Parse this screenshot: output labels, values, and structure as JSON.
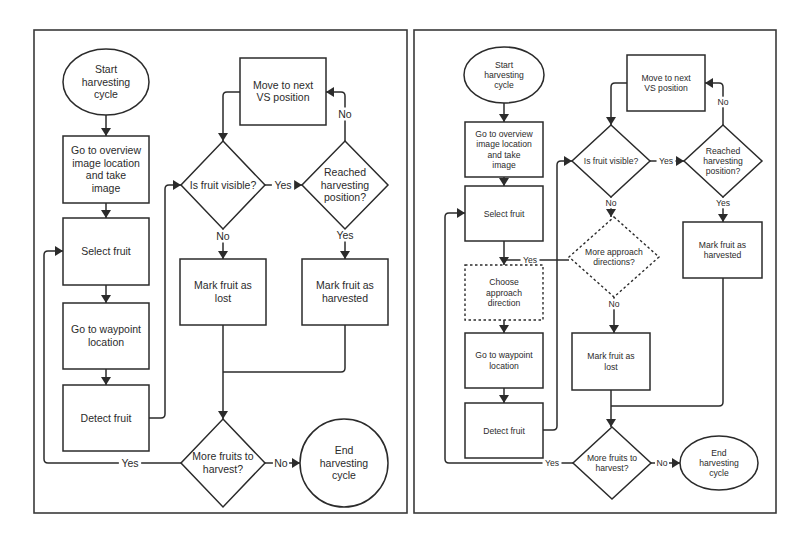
{
  "figure": {
    "colors": {
      "stroke": "#2b2b2b",
      "background": "#ffffff",
      "border": "#3a3a3a"
    },
    "panels": [
      {
        "id": "left",
        "name": "flowchart-original",
        "border": {
          "x": 34,
          "y": 30,
          "w": 373,
          "h": 483
        },
        "font_size": 10.5,
        "edge_font_size": 10.5,
        "nodes": [
          {
            "id": "start",
            "type": "ellipse",
            "cx": 106,
            "cy": 82,
            "rx": 43,
            "ry": 33,
            "lines": [
              "Start",
              "harvesting",
              "cycle"
            ]
          },
          {
            "id": "overview",
            "type": "rect",
            "x": 63,
            "y": 136,
            "w": 86,
            "h": 67,
            "lines": [
              "Go to overview",
              "image location",
              "and take",
              "image"
            ]
          },
          {
            "id": "select",
            "type": "rect",
            "x": 63,
            "y": 218,
            "w": 86,
            "h": 67,
            "lines": [
              "Select fruit"
            ]
          },
          {
            "id": "waypoint",
            "type": "rect",
            "x": 63,
            "y": 303,
            "w": 86,
            "h": 66,
            "lines": [
              "Go to waypoint",
              "location"
            ]
          },
          {
            "id": "detect",
            "type": "rect",
            "x": 63,
            "y": 385,
            "w": 86,
            "h": 66,
            "lines": [
              "Detect fruit"
            ]
          },
          {
            "id": "visible",
            "type": "diamond",
            "cx": 223,
            "cy": 185,
            "hw": 42,
            "hh": 44,
            "lines": [
              "Is fruit visible?"
            ]
          },
          {
            "id": "move",
            "type": "rect",
            "x": 240,
            "y": 58,
            "w": 86,
            "h": 67,
            "lines": [
              "Move to next",
              "VS position"
            ]
          },
          {
            "id": "reached",
            "type": "diamond",
            "cx": 345,
            "cy": 185,
            "hw": 43,
            "hh": 44,
            "lines": [
              "Reached",
              "harvesting",
              "position?"
            ]
          },
          {
            "id": "lost",
            "type": "rect",
            "x": 180,
            "y": 259,
            "w": 86,
            "h": 66,
            "lines": [
              "Mark fruit as",
              "lost"
            ]
          },
          {
            "id": "harvested",
            "type": "rect",
            "x": 302,
            "y": 259,
            "w": 86,
            "h": 66,
            "lines": [
              "Mark fruit as",
              "harvested"
            ]
          },
          {
            "id": "more",
            "type": "diamond",
            "cx": 223,
            "cy": 463,
            "hw": 42,
            "hh": 44,
            "lines": [
              "More fruits to",
              "harvest?"
            ]
          },
          {
            "id": "end",
            "type": "ellipse",
            "cx": 344,
            "cy": 463,
            "rx": 44,
            "ry": 44,
            "lines": [
              "End",
              "harvesting",
              "cycle"
            ]
          }
        ],
        "edges": [
          {
            "from": "start",
            "to": "overview",
            "points": [
              [
                106,
                115
              ],
              [
                106,
                136
              ]
            ]
          },
          {
            "from": "overview",
            "to": "select",
            "points": [
              [
                106,
                203
              ],
              [
                106,
                218
              ]
            ]
          },
          {
            "from": "select",
            "to": "waypoint",
            "points": [
              [
                106,
                285
              ],
              [
                106,
                303
              ]
            ]
          },
          {
            "from": "waypoint",
            "to": "detect",
            "points": [
              [
                106,
                369
              ],
              [
                106,
                385
              ]
            ]
          },
          {
            "from": "detect",
            "to": "visible",
            "points": [
              [
                149,
                418
              ],
              [
                165,
                418
              ],
              [
                165,
                185
              ],
              [
                181,
                185
              ]
            ]
          },
          {
            "from": "visible",
            "to": "reached",
            "points": [
              [
                265,
                185
              ],
              [
                302,
                185
              ]
            ],
            "label": "Yes",
            "label_x": 283,
            "label_y": 185
          },
          {
            "from": "visible",
            "to": "lost",
            "points": [
              [
                223,
                229
              ],
              [
                223,
                259
              ]
            ],
            "label": "No",
            "label_x": 223,
            "label_y": 236
          },
          {
            "from": "reached",
            "to": "move",
            "points": [
              [
                345,
                141
              ],
              [
                345,
                92
              ],
              [
                326,
                92
              ]
            ],
            "label": "No",
            "label_x": 345,
            "label_y": 114
          },
          {
            "from": "move",
            "to": "visible",
            "points": [
              [
                240,
                92
              ],
              [
                223,
                92
              ],
              [
                223,
                141
              ]
            ]
          },
          {
            "from": "reached",
            "to": "harvested",
            "points": [
              [
                345,
                229
              ],
              [
                345,
                259
              ]
            ],
            "label": "Yes",
            "label_x": 345,
            "label_y": 235
          },
          {
            "from": "lost",
            "to": "more",
            "points": [
              [
                223,
                325
              ],
              [
                223,
                419
              ]
            ]
          },
          {
            "from": "harvested",
            "to": "more",
            "points": [
              [
                345,
                325
              ],
              [
                345,
                372
              ],
              [
                223,
                372
              ]
            ],
            "noarrow": true
          },
          {
            "from": "more",
            "to": "end",
            "points": [
              [
                265,
                463
              ],
              [
                300,
                463
              ]
            ],
            "label": "No",
            "label_x": 281,
            "label_y": 463
          },
          {
            "from": "more",
            "to": "select",
            "points": [
              [
                181,
                463
              ],
              [
                44,
                463
              ],
              [
                44,
                251
              ],
              [
                63,
                251
              ]
            ],
            "label": "Yes",
            "label_x": 130,
            "label_y": 463
          }
        ]
      },
      {
        "id": "right",
        "name": "flowchart-with-approach-directions",
        "border": {
          "x": 414,
          "y": 30,
          "w": 362,
          "h": 483
        },
        "font_size": 8.6,
        "edge_font_size": 8.6,
        "nodes": [
          {
            "id": "start",
            "type": "ellipse",
            "cx": 504,
            "cy": 75,
            "rx": 40,
            "ry": 28,
            "lines": [
              "Start",
              "harvesting",
              "cycle"
            ]
          },
          {
            "id": "overview",
            "type": "rect",
            "x": 465,
            "y": 122,
            "w": 78,
            "h": 55,
            "lines": [
              "Go to overview",
              "image location",
              "and take",
              "image"
            ]
          },
          {
            "id": "select",
            "type": "rect",
            "x": 465,
            "y": 186,
            "w": 78,
            "h": 55,
            "lines": [
              "Select fruit"
            ]
          },
          {
            "id": "choose",
            "type": "rect",
            "dashed": true,
            "x": 465,
            "y": 265,
            "w": 78,
            "h": 55,
            "lines": [
              "Choose",
              "approach",
              "direction"
            ]
          },
          {
            "id": "waypoint",
            "type": "rect",
            "x": 465,
            "y": 333,
            "w": 78,
            "h": 55,
            "lines": [
              "Go to waypoint",
              "location"
            ]
          },
          {
            "id": "detect",
            "type": "rect",
            "x": 465,
            "y": 403,
            "w": 78,
            "h": 55,
            "lines": [
              "Detect fruit"
            ]
          },
          {
            "id": "visible",
            "type": "diamond",
            "cx": 611,
            "cy": 161,
            "hw": 39,
            "hh": 36,
            "lines": [
              "Is fruit visible?"
            ]
          },
          {
            "id": "move",
            "type": "rect",
            "x": 627,
            "y": 55,
            "w": 78,
            "h": 56,
            "lines": [
              "Move to next",
              "VS position"
            ]
          },
          {
            "id": "reached",
            "type": "diamond",
            "cx": 723,
            "cy": 161,
            "hw": 39,
            "hh": 36,
            "lines": [
              "Reached",
              "harvesting",
              "position?"
            ]
          },
          {
            "id": "approach",
            "type": "diamond",
            "dashed": true,
            "cx": 614,
            "cy": 257,
            "hw": 45,
            "hh": 40,
            "lines": [
              "More approach",
              "directions?"
            ]
          },
          {
            "id": "lost",
            "type": "rect",
            "x": 572,
            "y": 333,
            "w": 78,
            "h": 57,
            "lines": [
              "Mark fruit as",
              "lost"
            ]
          },
          {
            "id": "harvested",
            "type": "rect",
            "x": 683,
            "y": 222,
            "w": 79,
            "h": 56,
            "lines": [
              "Mark fruit as",
              "harvested"
            ]
          },
          {
            "id": "more",
            "type": "diamond",
            "cx": 612,
            "cy": 463,
            "hw": 39,
            "hh": 36,
            "lines": [
              "More fruits to",
              "harvest?"
            ]
          },
          {
            "id": "end",
            "type": "ellipse",
            "cx": 719,
            "cy": 463,
            "rx": 39,
            "ry": 27,
            "lines": [
              "End",
              "harvesting",
              "cycle"
            ]
          }
        ],
        "edges": [
          {
            "from": "start",
            "to": "overview",
            "points": [
              [
                504,
                103
              ],
              [
                504,
                122
              ]
            ]
          },
          {
            "from": "overview",
            "to": "select",
            "points": [
              [
                504,
                177
              ],
              [
                504,
                186
              ]
            ]
          },
          {
            "from": "select",
            "to": "choose",
            "points": [
              [
                504,
                241
              ],
              [
                504,
                265
              ]
            ]
          },
          {
            "from": "choose",
            "to": "waypoint",
            "points": [
              [
                504,
                320
              ],
              [
                504,
                333
              ]
            ]
          },
          {
            "from": "waypoint",
            "to": "detect",
            "points": [
              [
                504,
                388
              ],
              [
                504,
                403
              ]
            ]
          },
          {
            "from": "detect",
            "to": "visible",
            "points": [
              [
                543,
                430
              ],
              [
                557,
                430
              ],
              [
                557,
                161
              ],
              [
                572,
                161
              ]
            ]
          },
          {
            "from": "visible",
            "to": "reached",
            "points": [
              [
                650,
                161
              ],
              [
                684,
                161
              ]
            ],
            "label": "Yes",
            "label_x": 666,
            "label_y": 161
          },
          {
            "from": "visible",
            "to": "approach",
            "points": [
              [
                611,
                197
              ],
              [
                611,
                217
              ]
            ],
            "label": "No",
            "label_x": 611,
            "label_y": 203
          },
          {
            "from": "reached",
            "to": "move",
            "points": [
              [
                723,
                125
              ],
              [
                723,
                83
              ],
              [
                705,
                83
              ]
            ],
            "label": "No",
            "label_x": 723,
            "label_y": 102
          },
          {
            "from": "move",
            "to": "visible",
            "points": [
              [
                627,
                83
              ],
              [
                611,
                83
              ],
              [
                611,
                125
              ]
            ]
          },
          {
            "from": "reached",
            "to": "harvested",
            "points": [
              [
                723,
                197
              ],
              [
                723,
                222
              ]
            ],
            "label": "Yes",
            "label_x": 723,
            "label_y": 203
          },
          {
            "from": "approach",
            "to": "choose",
            "points": [
              [
                569,
                260
              ],
              [
                504,
                260
              ]
            ],
            "label": "Yes",
            "label_x": 530,
            "label_y": 260,
            "noarrow": true
          },
          {
            "from": "approach",
            "to": "lost",
            "points": [
              [
                614,
                297
              ],
              [
                614,
                333
              ]
            ],
            "label": "No",
            "label_x": 614,
            "label_y": 304
          },
          {
            "from": "lost",
            "to": "more",
            "points": [
              [
                611,
                390
              ],
              [
                611,
                427
              ]
            ]
          },
          {
            "from": "harvested",
            "to": "more",
            "points": [
              [
                723,
                278
              ],
              [
                723,
                406
              ],
              [
                611,
                406
              ]
            ],
            "noarrow": true
          },
          {
            "from": "more",
            "to": "end",
            "points": [
              [
                651,
                463
              ],
              [
                680,
                463
              ]
            ],
            "label": "No",
            "label_x": 662,
            "label_y": 463
          },
          {
            "from": "more",
            "to": "select",
            "points": [
              [
                573,
                463
              ],
              [
                445,
                463
              ],
              [
                445,
                213
              ],
              [
                465,
                213
              ]
            ],
            "label": "Yes",
            "label_x": 552,
            "label_y": 463
          }
        ]
      }
    ]
  }
}
